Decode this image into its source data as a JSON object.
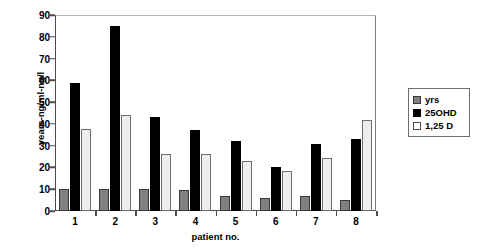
{
  "chart_data": {
    "type": "bar",
    "title": "",
    "xlabel": "patient no.",
    "ylabel": "years-ng/ml-ng/l",
    "categories": [
      "1",
      "2",
      "3",
      "4",
      "5",
      "6",
      "7",
      "8"
    ],
    "series": [
      {
        "name": "yrs",
        "color": "#808080",
        "values": [
          10,
          10,
          10,
          9.5,
          7,
          6,
          7,
          5
        ]
      },
      {
        "name": "25OHD",
        "color": "#000000",
        "values": [
          59,
          85,
          43,
          37,
          32,
          20,
          31,
          33
        ]
      },
      {
        "name": "1,25 D",
        "color": "#ffffff",
        "values": [
          37.5,
          44,
          26,
          26,
          23,
          18.5,
          24.5,
          42
        ]
      }
    ],
    "ylim": [
      0,
      90
    ],
    "ytick_labels": [
      "0",
      "10",
      "20",
      "30",
      "40",
      "50",
      "60",
      "70",
      "80",
      "90"
    ],
    "ytick_values": [
      0,
      10,
      20,
      30,
      40,
      50,
      60,
      70,
      80,
      90
    ],
    "grid": true,
    "legend_position": "right"
  },
  "legend": {
    "items": [
      {
        "label": "yrs"
      },
      {
        "label": "25OHD"
      },
      {
        "label": "1,25 D"
      }
    ]
  }
}
